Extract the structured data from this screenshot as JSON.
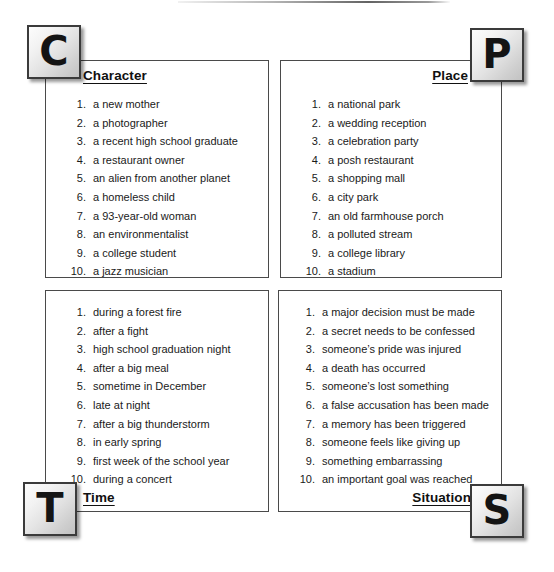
{
  "document": {
    "title": "Story Elements Chart",
    "layout": "four-quadrant",
    "colors": {
      "background": "#ffffff",
      "panel_border": "#4a4a4a",
      "tile_border": "#3b3b3b",
      "text": "#1a1a1a"
    }
  },
  "panels": {
    "character": {
      "tile_letter": "C",
      "heading": "Character",
      "items": [
        {
          "number": "1.",
          "text": "a new mother"
        },
        {
          "number": "2.",
          "text": "a photographer"
        },
        {
          "number": "3.",
          "text": "a recent high school graduate"
        },
        {
          "number": "4.",
          "text": "a restaurant owner"
        },
        {
          "number": "5.",
          "text": "an alien from another planet"
        },
        {
          "number": "6.",
          "text": "a homeless child"
        },
        {
          "number": "7.",
          "text": "a 93-year-old woman"
        },
        {
          "number": "8.",
          "text": "an environmentalist"
        },
        {
          "number": "9.",
          "text": "a college student"
        },
        {
          "number": "10.",
          "text": "a jazz musician"
        }
      ]
    },
    "place": {
      "tile_letter": "P",
      "heading": "Place",
      "items": [
        {
          "number": "1.",
          "text": "a national park"
        },
        {
          "number": "2.",
          "text": "a wedding reception"
        },
        {
          "number": "3.",
          "text": "a celebration party"
        },
        {
          "number": "4.",
          "text": "a posh restaurant"
        },
        {
          "number": "5.",
          "text": "a shopping mall"
        },
        {
          "number": "6.",
          "text": "a city park"
        },
        {
          "number": "7.",
          "text": "an old farmhouse porch"
        },
        {
          "number": "8.",
          "text": "a polluted stream"
        },
        {
          "number": "9.",
          "text": "a college library"
        },
        {
          "number": "10.",
          "text": "a stadium"
        }
      ]
    },
    "time": {
      "tile_letter": "T",
      "heading": "Time",
      "items": [
        {
          "number": "1.",
          "text": "during a forest fire"
        },
        {
          "number": "2.",
          "text": "after a fight"
        },
        {
          "number": "3.",
          "text": "high school graduation night"
        },
        {
          "number": "4.",
          "text": "after a big meal"
        },
        {
          "number": "5.",
          "text": "sometime in December"
        },
        {
          "number": "6.",
          "text": "late at night"
        },
        {
          "number": "7.",
          "text": "after a big thunderstorm"
        },
        {
          "number": "8.",
          "text": "in early spring"
        },
        {
          "number": "9.",
          "text": "first week of the school year"
        },
        {
          "number": "10.",
          "text": "during a concert"
        }
      ]
    },
    "situation": {
      "tile_letter": "S",
      "heading": "Situation",
      "items": [
        {
          "number": "1.",
          "text": "a major decision must be made"
        },
        {
          "number": "2.",
          "text": "a secret needs to be confessed"
        },
        {
          "number": "3.",
          "text": "someone’s pride was injured"
        },
        {
          "number": "4.",
          "text": "a death has occurred"
        },
        {
          "number": "5.",
          "text": "someone’s lost something"
        },
        {
          "number": "6.",
          "text": "a false accusation has been made"
        },
        {
          "number": "7.",
          "text": "a memory has been triggered"
        },
        {
          "number": "8.",
          "text": "someone feels like giving up"
        },
        {
          "number": "9.",
          "text": "something embarrassing"
        },
        {
          "number": "10.",
          "text": "an important goal was reached"
        }
      ]
    }
  }
}
